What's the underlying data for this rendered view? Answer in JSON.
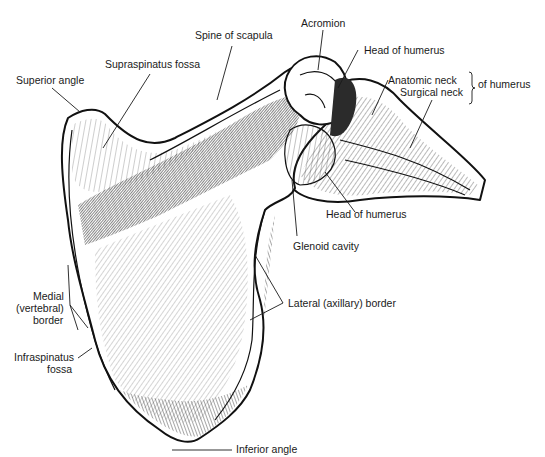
{
  "figure": {
    "labels": {
      "superior_angle": "Superior angle",
      "supraspinatus_fossa": "Supraspinatus fossa",
      "spine_of_scapula": "Spine of scapula",
      "acromion": "Acromion",
      "head_of_humerus_top": "Head of humerus",
      "anatomic_neck": "Anatomic neck",
      "surgical_neck": "Surgical neck",
      "of_humerus": "of humerus",
      "head_of_humerus_bottom": "Head of humerus",
      "glenoid_cavity": "Glenoid cavity",
      "lateral_border": "Lateral (axillary) border",
      "medial_border_line1": "Medial",
      "medial_border_line2": "(vertebral)",
      "medial_border_line3": "border",
      "infraspinatus_line1": "Infraspinatus",
      "infraspinatus_line2": "fossa",
      "inferior_angle": "Inferior angle"
    }
  }
}
